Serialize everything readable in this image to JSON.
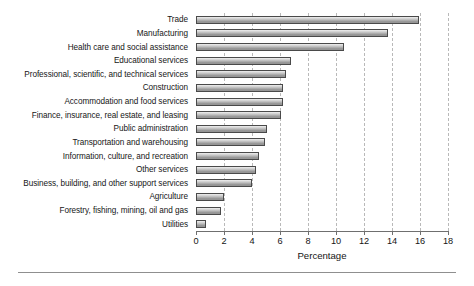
{
  "chart_data": {
    "type": "bar",
    "orientation": "horizontal",
    "title": "",
    "xlabel": "Percentage",
    "ylabel": "",
    "xlim": [
      0,
      18
    ],
    "xticks": [
      0,
      2,
      4,
      6,
      8,
      10,
      12,
      14,
      16,
      18
    ],
    "grid": "vertical-dashed",
    "legend": "none",
    "categories": [
      "Trade",
      "Manufacturing",
      "Health care and social assistance",
      "Educational services",
      "Professional, scientific, and technical services",
      "Construction",
      "Accommodation and food services",
      "Finance, insurance, real estate, and leasing",
      "Public administration",
      "Transportation and warehousing",
      "Information, culture, and recreation",
      "Other services",
      "Business, building, and other support services",
      "Agriculture",
      "Forestry, fishing, mining, oil and gas",
      "Utilities"
    ],
    "values": [
      15.9,
      13.7,
      10.6,
      6.8,
      6.4,
      6.2,
      6.2,
      6.1,
      5.1,
      4.9,
      4.5,
      4.3,
      4.0,
      2.0,
      1.8,
      0.7
    ]
  },
  "axis": {
    "x_title": "Percentage",
    "tick_labels": [
      "0",
      "2",
      "4",
      "6",
      "8",
      "10",
      "12",
      "14",
      "16",
      "18"
    ]
  },
  "colors": {
    "bar_border": "#4a4a4a",
    "bar_fill_light": "#efefef",
    "bar_fill_dark": "#8e8e8e",
    "gridline": "#b9b9b9",
    "axis": "#6f6f6f",
    "text": "#141414",
    "background": "#ffffff"
  }
}
